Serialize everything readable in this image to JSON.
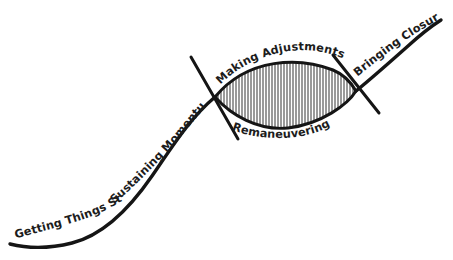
{
  "diagram": {
    "type": "annotated-s-curve",
    "background_color": "#ffffff",
    "stroke_color": "#151515",
    "text_color": "#1c1c1c",
    "hatch_color": "#2a2a2a",
    "labels": [
      {
        "id": "getting-things-started",
        "text": "Getting Things Started",
        "position": "lower-left, along rising tail of curve"
      },
      {
        "id": "sustaining-momentum",
        "text": "Sustaining Momentum",
        "position": "center-left, along steep diagonal of curve"
      },
      {
        "id": "making-adjustments",
        "text": "Making Adjustments",
        "position": "above hatched lens, following upper lens arc"
      },
      {
        "id": "remaneuvering",
        "text": "Remaneuvering",
        "position": "below hatched lens, following lower lens arc"
      },
      {
        "id": "bringing-closure",
        "text": "Bringing Closure",
        "position": "upper-right, along final rising curve"
      }
    ],
    "shapes": {
      "lens": {
        "name": "hatched-lens",
        "fill_pattern": "vertical-hatching",
        "hatch_spacing_px": 3
      },
      "ticks": [
        {
          "name": "left-tip-tick"
        },
        {
          "name": "right-tip-tick"
        }
      ]
    }
  }
}
